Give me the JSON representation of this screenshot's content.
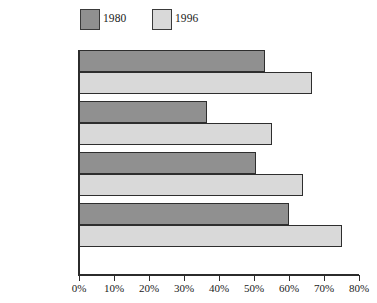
{
  "chart_data": {
    "type": "bar",
    "orientation": "horizontal",
    "title": "",
    "subtitle": "",
    "xlabel": "",
    "ylabel": "",
    "xlim": [
      0,
      80
    ],
    "xtick_labels": [
      "0%",
      "10%",
      "20%",
      "30%",
      "40%",
      "50%",
      "60%",
      "70%",
      "80%"
    ],
    "xtick_values": [
      0,
      10,
      20,
      30,
      40,
      50,
      60,
      70,
      80
    ],
    "grid": false,
    "legend_position": "top-left",
    "categories": [
      "Total",
      "With youngest\nchild under 3",
      "With youngest\nchild 3–5",
      "With youngest\nchild 6–17"
    ],
    "series": [
      {
        "name": "1980",
        "color": "#909090",
        "values": [
          53,
          36.5,
          50.5,
          60
        ]
      },
      {
        "name": "1996",
        "color": "#d9d9d9",
        "values": [
          66.5,
          55,
          64,
          75
        ]
      }
    ]
  },
  "legend": {
    "entries": [
      {
        "label": "1980",
        "color": "#909090"
      },
      {
        "label": "1996",
        "color": "#d9d9d9"
      }
    ]
  },
  "axis": {
    "ticks": [
      {
        "label": "0%",
        "value": 0
      },
      {
        "label": "10%",
        "value": 10
      },
      {
        "label": "20%",
        "value": 20
      },
      {
        "label": "30%",
        "value": 30
      },
      {
        "label": "40%",
        "value": 40
      },
      {
        "label": "50%",
        "value": 50
      },
      {
        "label": "60%",
        "value": 60
      },
      {
        "label": "70%",
        "value": 70
      },
      {
        "label": "80%",
        "value": 80
      }
    ]
  },
  "categories": [
    {
      "label": "Total"
    },
    {
      "label": "With youngest\nchild under 3"
    },
    {
      "label": "With youngest\nchild 3–5"
    },
    {
      "label": "With youngest\nchild 6–17"
    }
  ]
}
